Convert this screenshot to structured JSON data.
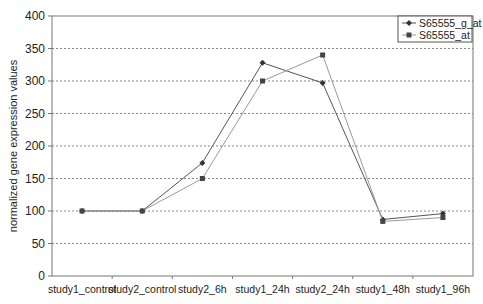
{
  "chart_data": {
    "type": "line",
    "title": "",
    "xlabel": "",
    "ylabel": "normalized gene expression values",
    "ylim": [
      0,
      400
    ],
    "yticks": [
      0,
      50,
      100,
      150,
      200,
      250,
      300,
      350,
      400
    ],
    "grid": "horizontal dotted",
    "legend_position": "top-right inside",
    "categories": [
      "study1_control",
      "study2_control",
      "study2_6h",
      "study1_24h",
      "study2_24h",
      "study1_48h",
      "study1_96h"
    ],
    "series": [
      {
        "name": "S65555_g_at",
        "marker": "diamond",
        "color": "#555555",
        "values": [
          100,
          100,
          174,
          328,
          297,
          87,
          96
        ]
      },
      {
        "name": "S65555_at",
        "marker": "square",
        "color": "#999999",
        "values": [
          100,
          100,
          150,
          300,
          340,
          84,
          90
        ]
      }
    ]
  }
}
